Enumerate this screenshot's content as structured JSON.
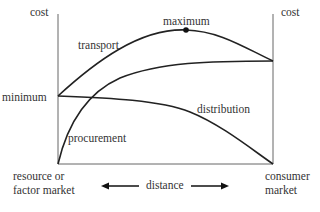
{
  "axes": {
    "left_label": "cost",
    "right_label": "cost",
    "min_label": "minimum",
    "bottom_left_label_line1": "resource or",
    "bottom_left_label_line2": "factor market",
    "bottom_right_label_line1": "consumer",
    "bottom_right_label_line2": "market",
    "distance_label": "distance"
  },
  "curves": {
    "transport": "transport",
    "procurement": "procurement",
    "distribution": "distribution",
    "maximum": "maximum"
  },
  "colors": {
    "line": "#222222",
    "axis": "#555555"
  }
}
